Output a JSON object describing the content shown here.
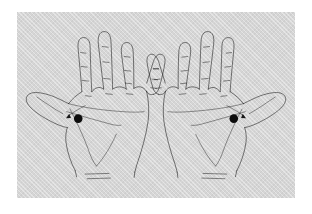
{
  "figure": {
    "title": "Acupressure point location on both hands",
    "panel": {
      "background_color": "#d5d5d5",
      "border_color": "#ffffff",
      "x": 17,
      "y": 12,
      "width": 278,
      "height": 186
    },
    "ink_color": "#181818",
    "marker_color": "#0d0d0d"
  },
  "hands": [
    {
      "id": "left-hand",
      "label": "Left hand, palm view",
      "orientation": "palm-up",
      "thumb_side": "left",
      "marker": {
        "label": "Acupressure point marker",
        "shape": "filled-circle",
        "cx": 185,
        "cy": 321,
        "r": 13,
        "color": "#0d0d0d"
      },
      "arrow": {
        "label": "Pointer arrow to acupressure point",
        "direction": "down-left"
      },
      "fingers": [
        {
          "name": "index",
          "crease_count": 3
        },
        {
          "name": "middle",
          "crease_count": 3
        },
        {
          "name": "ring",
          "crease_count": 3
        },
        {
          "name": "little",
          "crease_count": 3
        },
        {
          "name": "thumb",
          "crease_count": 1
        }
      ],
      "palm_creases": [
        "heart-line",
        "head-line",
        "life-line"
      ],
      "wrist_creases": 2
    },
    {
      "id": "right-hand",
      "label": "Right hand, palm view",
      "orientation": "palm-up",
      "thumb_side": "right",
      "marker": {
        "label": "Acupressure point marker",
        "shape": "filled-circle",
        "cx": 185,
        "cy": 321,
        "r": 13,
        "color": "#0d0d0d"
      },
      "arrow": {
        "label": "Pointer arrow to acupressure point",
        "direction": "down-right"
      },
      "fingers": [
        {
          "name": "index",
          "crease_count": 3
        },
        {
          "name": "middle",
          "crease_count": 3
        },
        {
          "name": "ring",
          "crease_count": 3
        },
        {
          "name": "little",
          "crease_count": 3
        },
        {
          "name": "thumb",
          "crease_count": 1
        }
      ],
      "palm_creases": [
        "heart-line",
        "head-line",
        "life-line"
      ],
      "wrist_creases": 2
    }
  ]
}
